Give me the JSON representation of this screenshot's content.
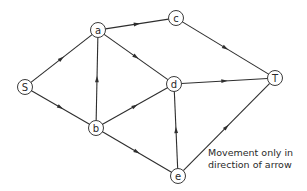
{
  "diagram": {
    "type": "directed-network",
    "nodes": [
      {
        "id": "S",
        "label": "S",
        "x": 25,
        "y": 87
      },
      {
        "id": "a",
        "label": "a",
        "x": 98,
        "y": 30
      },
      {
        "id": "b",
        "label": "b",
        "x": 96,
        "y": 128
      },
      {
        "id": "c",
        "label": "c",
        "x": 176,
        "y": 18
      },
      {
        "id": "d",
        "label": "d",
        "x": 174,
        "y": 84
      },
      {
        "id": "e",
        "label": "e",
        "x": 178,
        "y": 176
      },
      {
        "id": "T",
        "label": "T",
        "x": 275,
        "y": 78
      }
    ],
    "edges": [
      {
        "from": "S",
        "to": "a"
      },
      {
        "from": "S",
        "to": "b"
      },
      {
        "from": "a",
        "to": "c"
      },
      {
        "from": "a",
        "to": "d"
      },
      {
        "from": "b",
        "to": "a"
      },
      {
        "from": "b",
        "to": "d"
      },
      {
        "from": "b",
        "to": "e"
      },
      {
        "from": "e",
        "to": "d"
      },
      {
        "from": "c",
        "to": "T"
      },
      {
        "from": "d",
        "to": "T"
      },
      {
        "from": "e",
        "to": "T"
      }
    ],
    "note": {
      "line1": "Movement only in",
      "line2": "direction of arrow"
    },
    "colors": {
      "stroke": "#2e2e2e",
      "background": "#ffffff"
    }
  }
}
